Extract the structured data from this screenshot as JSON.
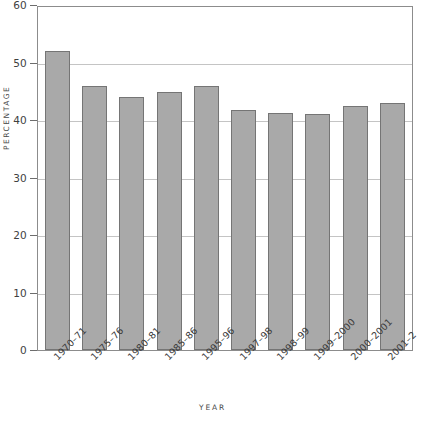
{
  "chart_data": {
    "type": "bar",
    "title": "",
    "xlabel": "YEAR",
    "ylabel": "PERCENTAGE",
    "categories": [
      "1970–71",
      "1975–76",
      "1980–81",
      "1985–86",
      "1995–96",
      "1997–98",
      "1998–99",
      "1999–2000",
      "2000–2001",
      "2001–2"
    ],
    "values": [
      52,
      46,
      44,
      44.8,
      45.9,
      41.8,
      41.2,
      41,
      42.5,
      43
    ],
    "ylim": [
      0,
      60
    ],
    "ytick_labels": [
      "0",
      "10",
      "20",
      "30",
      "40",
      "50",
      "60"
    ],
    "ytick_values": [
      0,
      10,
      20,
      30,
      40,
      50,
      60
    ],
    "grid": true,
    "legend": "none",
    "bar_color": "#a9a9a9",
    "bar_border_color": "#757575",
    "gridline_color": "#c4c4c4",
    "frame_color": "#8c8c8c"
  },
  "axes": {
    "y_title": "PERCENTAGE",
    "x_title": "YEAR"
  },
  "title_remnant": ""
}
